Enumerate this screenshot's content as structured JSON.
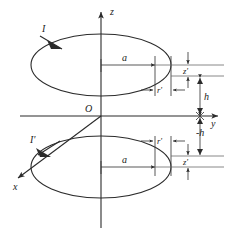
{
  "figure": {
    "background_color": "#ffffff",
    "line_color": "#2b2b2b",
    "label_color": "#1a1a1a"
  },
  "axes": {
    "z_label": "z",
    "y_label": "y",
    "x_label": "x",
    "origin_label": "O"
  },
  "labels": {
    "current_upper": "I",
    "current_lower": "I'",
    "radius_upper": "a",
    "radius_lower": "a",
    "offset_upper": "r'",
    "offset_lower": "r'",
    "height_upper": "h",
    "height_lower": "-h",
    "z_prime_upper": "z'",
    "z_prime_lower": "z'"
  }
}
